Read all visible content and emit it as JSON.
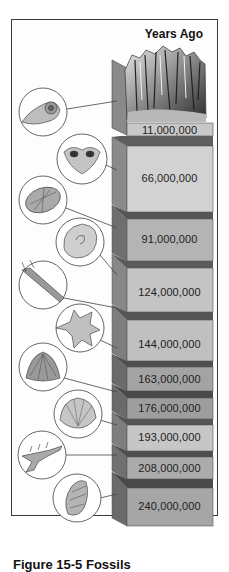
{
  "figure": {
    "title": "Years Ago",
    "caption": "Figure 15-5 Fossils"
  },
  "column": {
    "layers": [
      {
        "label": "11,000,000",
        "fossil": "ammonite-icon"
      },
      {
        "label": "66,000,000",
        "fossil": "brachiopod-icon"
      },
      {
        "label": "91,000,000",
        "fossil": "sea-urchin-icon"
      },
      {
        "label": "124,000,000",
        "fossil": "nautilus-icon"
      },
      {
        "label": "144,000,000",
        "fossil": "belemnite-icon"
      },
      {
        "label": "163,000,000",
        "fossil": "starfish-icon"
      },
      {
        "label": "176,000,000",
        "fossil": "fan-shell-icon"
      },
      {
        "label": "193,000,000",
        "fossil": "scallop-icon"
      },
      {
        "label": "208,000,000",
        "fossil": "branching-coral-icon"
      },
      {
        "label": "240,000,000",
        "fossil": "gastropod-icon"
      }
    ]
  },
  "colors": {
    "top_face": "#5e5e5e",
    "side_face": "#7a7a7a",
    "front_light": "#c9c9c9",
    "front_mid": "#b2b2b2",
    "front_dark": "#9a9a9a",
    "line": "#444444"
  }
}
